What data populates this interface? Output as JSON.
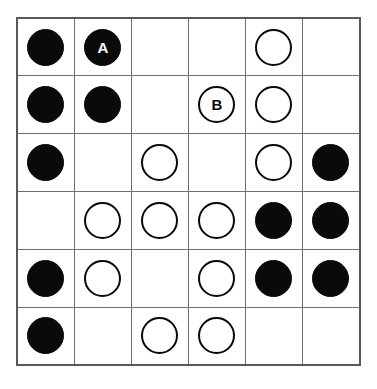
{
  "board": {
    "name": "stone-grid-puzzle",
    "rows": 6,
    "columns": 6,
    "colors": {
      "black_stone": "#0a0a0a",
      "white_stone_fill": "#ffffff",
      "white_stone_ring": "#0a0a0a",
      "grid_line": "#6a6f73",
      "border": "#555a5e",
      "background": "#ffffff",
      "black_label_text": "#ffffff",
      "white_label_text": "#0a0a0a"
    },
    "cells": [
      [
        {
          "state": "black",
          "label": ""
        },
        {
          "state": "black",
          "label": "A"
        },
        {
          "state": "empty",
          "label": ""
        },
        {
          "state": "empty",
          "label": ""
        },
        {
          "state": "white",
          "label": ""
        },
        {
          "state": "empty",
          "label": ""
        }
      ],
      [
        {
          "state": "black",
          "label": ""
        },
        {
          "state": "black",
          "label": ""
        },
        {
          "state": "empty",
          "label": ""
        },
        {
          "state": "white",
          "label": "B"
        },
        {
          "state": "white",
          "label": ""
        },
        {
          "state": "empty",
          "label": ""
        }
      ],
      [
        {
          "state": "black",
          "label": ""
        },
        {
          "state": "empty",
          "label": ""
        },
        {
          "state": "white",
          "label": ""
        },
        {
          "state": "empty",
          "label": ""
        },
        {
          "state": "white",
          "label": ""
        },
        {
          "state": "black",
          "label": ""
        }
      ],
      [
        {
          "state": "empty",
          "label": ""
        },
        {
          "state": "white",
          "label": ""
        },
        {
          "state": "white",
          "label": ""
        },
        {
          "state": "white",
          "label": ""
        },
        {
          "state": "black",
          "label": ""
        },
        {
          "state": "black",
          "label": ""
        }
      ],
      [
        {
          "state": "black",
          "label": ""
        },
        {
          "state": "white",
          "label": ""
        },
        {
          "state": "empty",
          "label": ""
        },
        {
          "state": "white",
          "label": ""
        },
        {
          "state": "black",
          "label": ""
        },
        {
          "state": "black",
          "label": ""
        }
      ],
      [
        {
          "state": "black",
          "label": ""
        },
        {
          "state": "empty",
          "label": ""
        },
        {
          "state": "white",
          "label": ""
        },
        {
          "state": "white",
          "label": ""
        },
        {
          "state": "empty",
          "label": ""
        },
        {
          "state": "empty",
          "label": ""
        }
      ]
    ]
  }
}
